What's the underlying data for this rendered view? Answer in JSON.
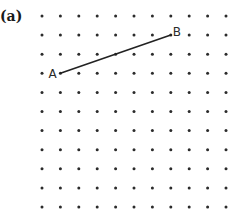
{
  "figure": {
    "panel_label": "(a)",
    "grid": {
      "columns": 11,
      "rows": 11,
      "x_start": 42,
      "y_start": 16,
      "x_step": 18.4,
      "y_step": 19.1,
      "dot_radius": 1.5,
      "dot_color": "#2b2b2b"
    },
    "points": [
      {
        "label": "A",
        "col": 1,
        "row": 3
      },
      {
        "label": "B",
        "col": 7,
        "row": 1
      }
    ],
    "segment": {
      "from": "A",
      "to": "B",
      "color": "#222222",
      "width": 1.6
    }
  }
}
